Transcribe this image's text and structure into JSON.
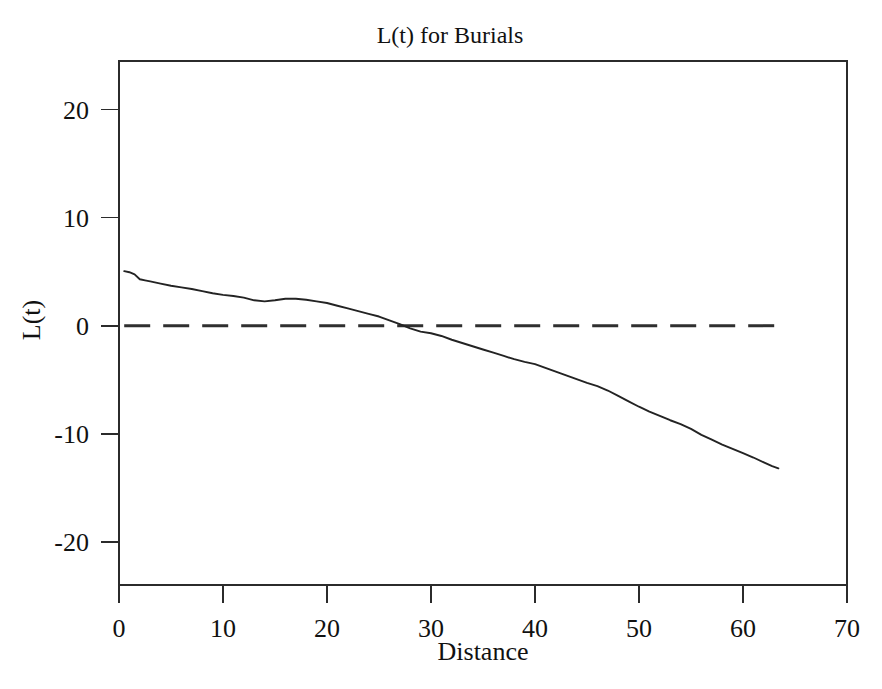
{
  "chart_data": {
    "type": "line",
    "title": "L(t) for Burials",
    "xlabel": "Distance",
    "ylabel": "L(t)",
    "xlim": [
      0,
      70
    ],
    "ylim": [
      -24,
      24.5
    ],
    "xticks": [
      0,
      10,
      20,
      30,
      40,
      50,
      60,
      70
    ],
    "xtick_labels": [
      "0",
      "10",
      "20",
      "30",
      "40",
      "50",
      "60",
      "70"
    ],
    "yticks": [
      20,
      10,
      0,
      -10,
      -20
    ],
    "ytick_labels": [
      "20",
      "10",
      "0",
      "-10",
      "-20"
    ],
    "grid": false,
    "legend": "none",
    "frame": "box",
    "series": [
      {
        "name": "L(t)",
        "style": "solid",
        "color": "#232323",
        "x": [
          0.5,
          1.0,
          1.5,
          2.0,
          2.5,
          3.0,
          4.0,
          5.0,
          6.0,
          7.0,
          8.0,
          9.0,
          10.0,
          11.0,
          12.0,
          13.0,
          14.0,
          15.0,
          16.0,
          17.0,
          18.0,
          19.0,
          20.0,
          21.0,
          22.0,
          23.0,
          24.0,
          25.0,
          26.0,
          27.0,
          28.0,
          29.0,
          30.0,
          31.0,
          32.0,
          33.0,
          34.0,
          35.0,
          36.0,
          37.0,
          38.0,
          39.0,
          40.0,
          41.0,
          42.0,
          43.0,
          44.0,
          45.0,
          46.0,
          47.0,
          48.0,
          49.0,
          50.0,
          51.0,
          52.0,
          53.0,
          54.0,
          55.0,
          56.0,
          57.0,
          58.0,
          59.0,
          60.0,
          61.0,
          62.0,
          62.8,
          63.4
        ],
        "y": [
          5.05,
          4.95,
          4.75,
          4.3,
          4.2,
          4.1,
          3.9,
          3.7,
          3.55,
          3.4,
          3.2,
          3.0,
          2.85,
          2.75,
          2.6,
          2.35,
          2.25,
          2.35,
          2.5,
          2.5,
          2.4,
          2.25,
          2.1,
          1.85,
          1.6,
          1.35,
          1.1,
          0.85,
          0.5,
          0.15,
          -0.25,
          -0.55,
          -0.7,
          -0.95,
          -1.3,
          -1.6,
          -1.9,
          -2.2,
          -2.5,
          -2.8,
          -3.1,
          -3.35,
          -3.55,
          -3.9,
          -4.25,
          -4.6,
          -4.95,
          -5.3,
          -5.6,
          -6.0,
          -6.5,
          -7.0,
          -7.5,
          -7.95,
          -8.35,
          -8.75,
          -9.1,
          -9.55,
          -10.1,
          -10.55,
          -11.0,
          -11.4,
          -11.8,
          -12.2,
          -12.65,
          -13.0,
          -13.2
        ]
      },
      {
        "name": "zero reference",
        "style": "dashed",
        "color": "#2f2f2f",
        "x": [
          0.5,
          63.4
        ],
        "y": [
          0,
          0
        ]
      }
    ],
    "annotations": [],
    "notes": {
      "curve_start_value": 5.05,
      "curve_end_value": -13.2,
      "zero_crossing_x": 27.4,
      "local_plateau_x_range": [
        14,
        18
      ]
    }
  },
  "plot_geometry": {
    "left": 119,
    "right": 847,
    "top": 61,
    "bottom": 585
  }
}
